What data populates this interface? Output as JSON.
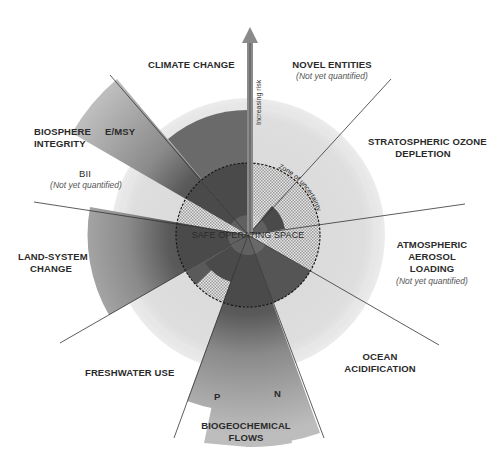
{
  "center_label": "SAFE OPERATING SPACE",
  "zone_label": "Zone of uncertainty",
  "arrow_label": "Increasing risk",
  "colors": {
    "safe_dark": "#4a4a4a",
    "beyond_mid": "#7d7d7d",
    "beyond_light": "#b8b8b8",
    "hatch": "#cfcfcf",
    "globe": "#e4e4e4",
    "line": "#333333"
  },
  "boundaries": [
    {
      "id": "novel-entities",
      "label": "NOVEL ENTITIES",
      "note": "(Not yet quantified)"
    },
    {
      "id": "stratospheric-ozone",
      "label": "STRATOSPHERIC OZONE DEPLETION",
      "line1": "STRATOSPHERIC OZONE",
      "line2": "DEPLETION"
    },
    {
      "id": "atmospheric-aerosol",
      "label": "ATMOSPHERIC AEROSOL LOADING",
      "line1": "ATMOSPHERIC",
      "line2": "AEROSOL",
      "line3": "LOADING",
      "note": "(Not yet quantified)"
    },
    {
      "id": "ocean-acidification",
      "label": "OCEAN ACIDIFICATION",
      "line1": "OCEAN",
      "line2": "ACIDIFICATION"
    },
    {
      "id": "biogeochemical-flows",
      "label": "BIOGEOCHEMICAL FLOWS",
      "line1": "BIOGEOCHEMICAL",
      "line2": "FLOWS",
      "sub_p": "P",
      "sub_n": "N"
    },
    {
      "id": "freshwater-use",
      "label": "FRESHWATER USE"
    },
    {
      "id": "land-system-change",
      "label": "LAND-SYSTEM CHANGE",
      "line1": "LAND-SYSTEM",
      "line2": "CHANGE"
    },
    {
      "id": "biosphere-integrity",
      "label": "BIOSPHERE INTEGRITY",
      "line1": "BIOSPHERE",
      "line2": "INTEGRITY",
      "sub_emsy": "E/MSY",
      "sub_bii": "BII",
      "note": "(Not yet quantified)"
    },
    {
      "id": "climate-change",
      "label": "CLIMATE CHANGE"
    }
  ]
}
